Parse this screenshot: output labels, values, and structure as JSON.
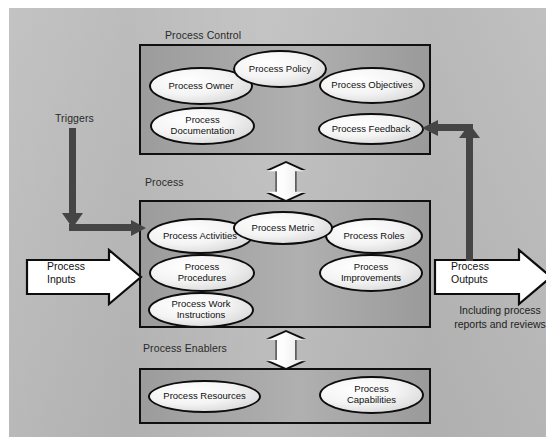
{
  "diagram": {
    "background_color": "#b8b8b8",
    "box_fill_color": "#a3a3a3",
    "ellipse_fill_color": "#f4f4f4",
    "outline_color": "#0d0d0d",
    "connector_color": "#454545"
  },
  "sections": {
    "control": {
      "label": "Process Control",
      "nodes": [
        {
          "label": "Process Owner"
        },
        {
          "label": "Process Policy"
        },
        {
          "label": "Process Objectives"
        },
        {
          "label": "Process\nDocumentation"
        },
        {
          "label": "Process Feedback"
        }
      ]
    },
    "process": {
      "label": "Process",
      "nodes": [
        {
          "label": "Process Activities"
        },
        {
          "label": "Process Metric"
        },
        {
          "label": "Process Roles"
        },
        {
          "label": "Process\nProcedures"
        },
        {
          "label": "Process\nImprovements"
        },
        {
          "label": "Process Work\nInstructions"
        }
      ]
    },
    "enablers": {
      "label": "Process Enablers",
      "nodes": [
        {
          "label": "Process Resources"
        },
        {
          "label": "Process\nCapabilities"
        }
      ]
    }
  },
  "flows": {
    "triggers_label": "Triggers",
    "inputs_label": "Process\nInputs",
    "outputs_label": "Process\nOutputs",
    "outputs_note": "Including process\nreports and reviews"
  }
}
